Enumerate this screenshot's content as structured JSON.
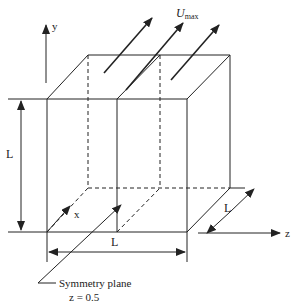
{
  "diagram": {
    "colors": {
      "stroke": "#222222",
      "background": "#ffffff"
    },
    "labels": {
      "y_axis": "y",
      "x_axis": "x",
      "z_axis": "z",
      "velocity_main": "U",
      "velocity_sub": "max",
      "dim_height": "L",
      "dim_width": "L",
      "dim_depth": "L",
      "symmetry_line1": "Symmetry plane",
      "symmetry_line2": "z = 0.5"
    }
  }
}
